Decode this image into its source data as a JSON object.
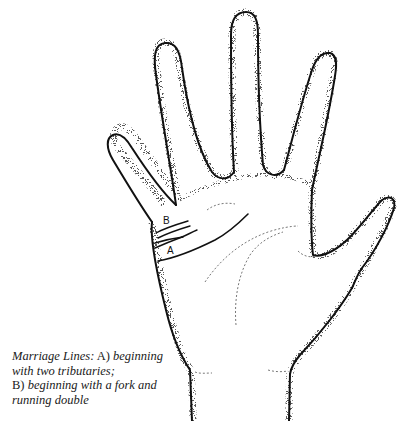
{
  "figure": {
    "labels": {
      "a": "A",
      "b": "B"
    }
  },
  "caption": {
    "title": "Marriage Lines:",
    "part_a_marker": "A)",
    "part_a_text_1": "beginning",
    "part_a_text_2": "with two tributaries;",
    "part_b_marker": "B)",
    "part_b_text_1": "beginning with a fork and",
    "part_b_text_2": "running double"
  },
  "colors": {
    "ink": "#111111",
    "stipple": "#555555",
    "background": "#ffffff"
  }
}
